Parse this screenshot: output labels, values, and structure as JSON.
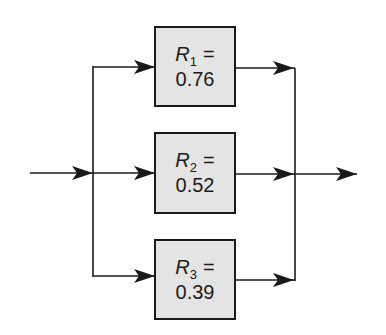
{
  "diagram": {
    "type": "parallel-reliability-block-diagram",
    "blocks": [
      {
        "symbol": "R",
        "subscript": "1",
        "equals": "=",
        "value": "0.76"
      },
      {
        "symbol": "R",
        "subscript": "2",
        "equals": "=",
        "value": "0.52"
      },
      {
        "symbol": "R",
        "subscript": "3",
        "equals": "=",
        "value": "0.39"
      }
    ],
    "colors": {
      "box_fill": "#e4e4e4",
      "stroke": "#1a1a1a"
    }
  }
}
